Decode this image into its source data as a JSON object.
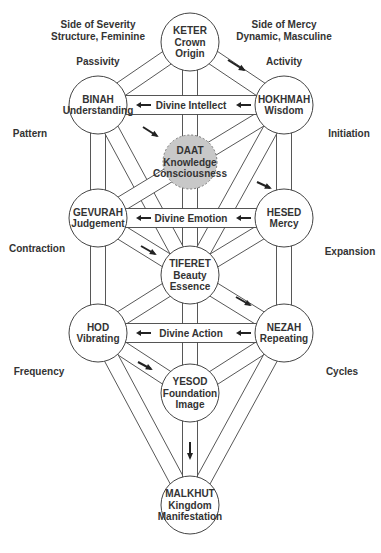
{
  "diagram": {
    "pillar_headings": {
      "left": [
        "Side of Severity",
        "Structure, Feminine"
      ],
      "right": [
        "Side of Mercy",
        "Dynamic, Masculine"
      ]
    },
    "side_labels": {
      "left": [
        "Passivity",
        "Pattern",
        "Contraction",
        "Frequency"
      ],
      "right": [
        "Activity",
        "Initiation",
        "Expansion",
        "Cycles"
      ]
    },
    "spheres": [
      {
        "id": "keter",
        "lines": [
          "KETER",
          "Crown",
          "Origin"
        ]
      },
      {
        "id": "binah",
        "lines": [
          "BINAH",
          "Understanding"
        ]
      },
      {
        "id": "hokhmah",
        "lines": [
          "HOKHMAH",
          "Wisdom"
        ]
      },
      {
        "id": "daat",
        "lines": [
          "DAAT",
          "Knowledge",
          "Consciousness"
        ],
        "hidden": true
      },
      {
        "id": "gevurah",
        "lines": [
          "GEVURAH",
          "Judgement"
        ]
      },
      {
        "id": "hesed",
        "lines": [
          "HESED",
          "Mercy"
        ]
      },
      {
        "id": "tiferet",
        "lines": [
          "TIFERET",
          "Beauty",
          "Essence"
        ]
      },
      {
        "id": "hod",
        "lines": [
          "HOD",
          "Vibrating"
        ]
      },
      {
        "id": "nezah",
        "lines": [
          "NEZAH",
          "Repeating"
        ]
      },
      {
        "id": "yesod",
        "lines": [
          "YESOD",
          "Foundation",
          "Image"
        ]
      },
      {
        "id": "malkhut",
        "lines": [
          "MALKHUT",
          "Kingdom",
          "Manifestation"
        ]
      }
    ],
    "horizontal_paths": [
      {
        "label": "Divine Intellect",
        "from": "hokhmah",
        "to": "binah"
      },
      {
        "label": "Divine Emotion",
        "from": "hesed",
        "to": "gevurah"
      },
      {
        "label": "Divine Action",
        "from": "nezah",
        "to": "hod"
      }
    ],
    "channels": [
      [
        "keter",
        "binah"
      ],
      [
        "keter",
        "hokhmah"
      ],
      [
        "keter",
        "tiferet"
      ],
      [
        "binah",
        "gevurah"
      ],
      [
        "binah",
        "tiferet"
      ],
      [
        "hokhmah",
        "hesed"
      ],
      [
        "hokhmah",
        "tiferet"
      ],
      [
        "hokhmah",
        "gevurah"
      ],
      [
        "gevurah",
        "hod"
      ],
      [
        "gevurah",
        "tiferet"
      ],
      [
        "hesed",
        "nezah"
      ],
      [
        "hesed",
        "tiferet"
      ],
      [
        "tiferet",
        "hod"
      ],
      [
        "tiferet",
        "nezah"
      ],
      [
        "tiferet",
        "yesod"
      ],
      [
        "hod",
        "yesod"
      ],
      [
        "nezah",
        "yesod"
      ],
      [
        "hod",
        "malkhut"
      ],
      [
        "nezah",
        "malkhut"
      ],
      [
        "yesod",
        "malkhut"
      ]
    ],
    "flow_arrows": [
      {
        "from": "keter",
        "to": "hokhmah"
      },
      {
        "from": "binah",
        "to": "daat"
      },
      {
        "from": "hokhmah",
        "to": "gevurah"
      },
      {
        "from": "gevurah",
        "to": "tiferet"
      },
      {
        "from": "tiferet",
        "to": "nezah"
      },
      {
        "from": "hod",
        "to": "yesod"
      },
      {
        "from": "yesod",
        "to": "malkhut"
      }
    ]
  }
}
